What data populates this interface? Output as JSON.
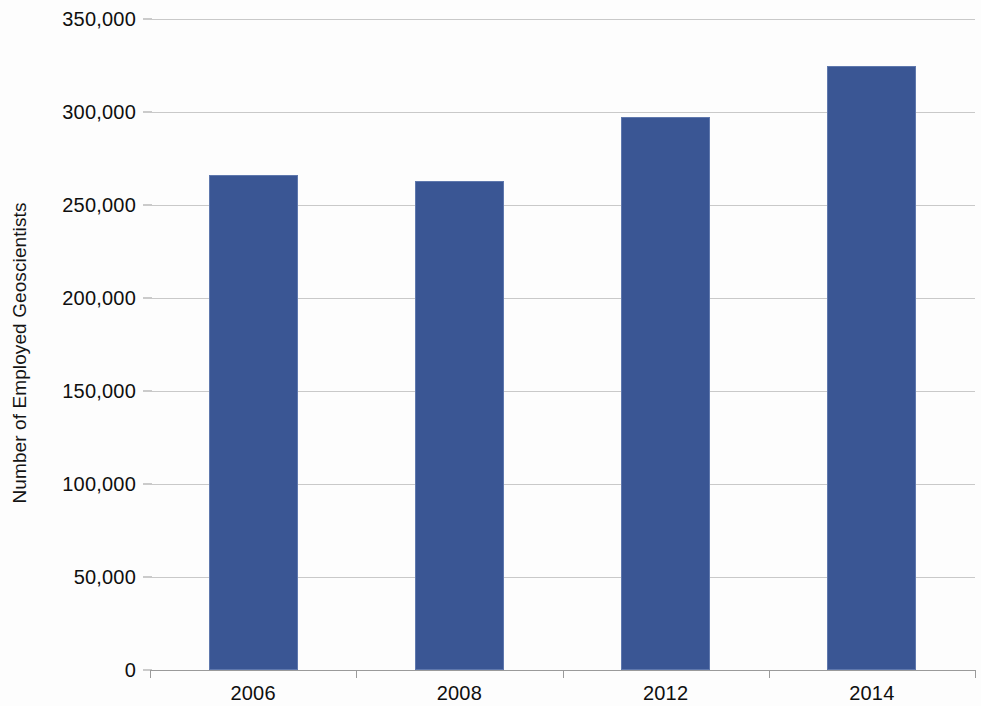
{
  "chart_data": {
    "type": "bar",
    "title": "",
    "subtitle": "",
    "xlabel": "",
    "ylabel": "Number of Employed Geoscientists",
    "categories": [
      "2006",
      "2008",
      "2012",
      "2014"
    ],
    "values": [
      266000,
      263000,
      297500,
      325000
    ],
    "series": [
      {
        "name": "Employed Geoscientists",
        "values": [
          266000,
          263000,
          297500,
          325000
        ]
      }
    ],
    "ylim": [
      0,
      350000
    ],
    "ytick_values": [
      0,
      50000,
      100000,
      150000,
      200000,
      250000,
      300000,
      350000
    ],
    "ytick_labels": [
      "0",
      "50,000",
      "100,000",
      "150,000",
      "200,000",
      "250,000",
      "300,000",
      "350,000"
    ],
    "grid": true,
    "grid_axis": "y",
    "legend": false,
    "legend_position": "none",
    "bar_color": "#3a5694",
    "bar_border_color": "#5f78ad",
    "gridline_color": "#c9c9c9",
    "axis_color": "#9a9a9a",
    "background_color": "#fdfdfd",
    "text_color": "#0f0f0f"
  }
}
